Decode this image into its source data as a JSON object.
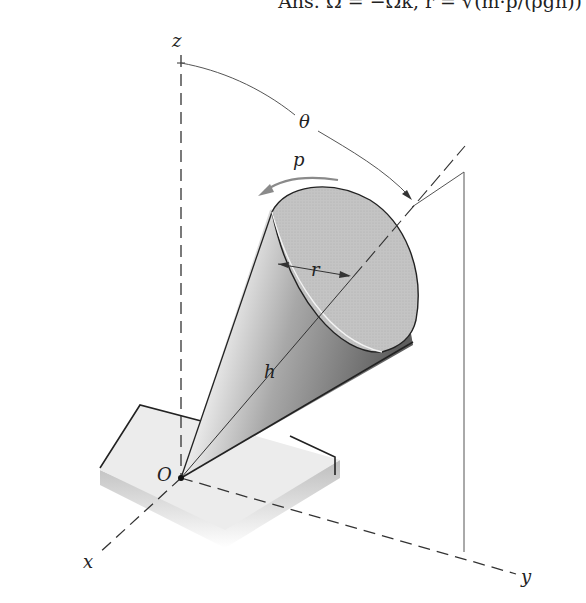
{
  "answer": {
    "prefix": "Ans. ",
    "omega": "Ω = −Ωk,",
    "r_eq": " r = √(m·p/(ρgh))"
  },
  "labels": {
    "z": "z",
    "x": "x",
    "y": "y",
    "origin": "O",
    "theta": "θ",
    "p": "p",
    "r": "r",
    "h": "h"
  },
  "colors": {
    "line": "#333333",
    "cone_light": "#f2f2f2",
    "cone_dark": "#6a6a6a",
    "cone_face": "#bdbdbd",
    "base_top": "#ececec",
    "arrow_p": "#8a8a8a"
  }
}
